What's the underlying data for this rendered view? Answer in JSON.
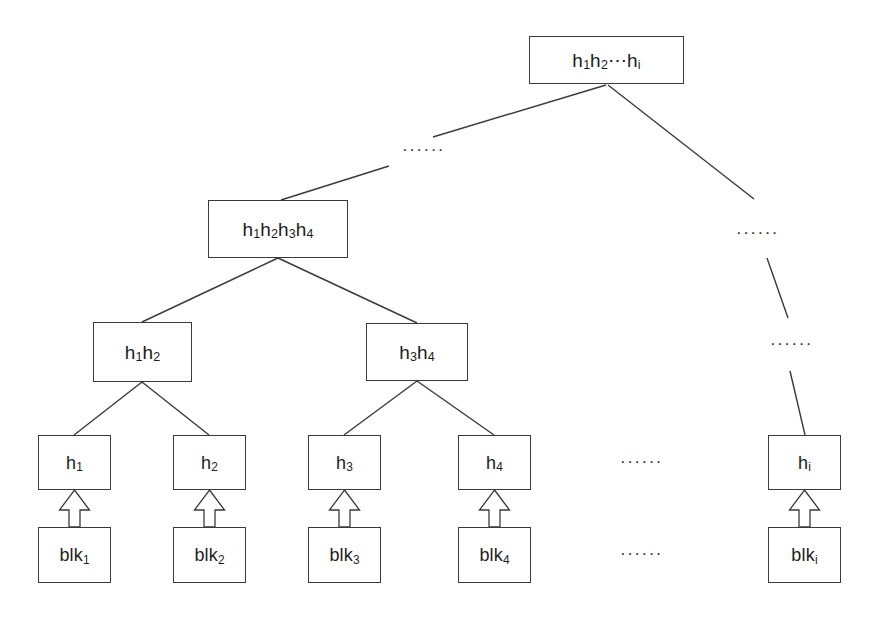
{
  "diagram": {
    "type": "tree",
    "canvas": {
      "width": 874,
      "height": 621
    },
    "colors": {
      "background": "#ffffff",
      "stroke": "#3a3a3a",
      "text": "#1d1d1d",
      "arrow_fill": "#ffffff"
    },
    "nodes": [
      {
        "id": "root",
        "base": "h",
        "sub": "1",
        "text": "h1h2⋯hi",
        "x": 529,
        "y": 36,
        "w": 155,
        "h": 48,
        "font_size": 19
      },
      {
        "id": "n1234",
        "base": "h",
        "sub": "1",
        "text": "h1h2h3h4",
        "x": 208,
        "y": 200,
        "w": 140,
        "h": 58,
        "font_size": 19
      },
      {
        "id": "n12",
        "base": "h",
        "sub": "1",
        "text": "h1h2",
        "x": 93,
        "y": 322,
        "w": 99,
        "h": 60,
        "font_size": 19
      },
      {
        "id": "n34",
        "base": "h",
        "sub": "3",
        "text": "h3h4",
        "x": 366,
        "y": 323,
        "w": 102,
        "h": 58,
        "font_size": 19
      },
      {
        "id": "h1",
        "base": "h",
        "sub": "1",
        "text": "h1",
        "x": 38,
        "y": 435,
        "w": 73,
        "h": 55,
        "font_size": 18
      },
      {
        "id": "h2",
        "base": "h",
        "sub": "2",
        "text": "h2",
        "x": 173,
        "y": 435,
        "w": 73,
        "h": 55,
        "font_size": 18
      },
      {
        "id": "h3",
        "base": "h",
        "sub": "3",
        "text": "h3",
        "x": 308,
        "y": 435,
        "w": 73,
        "h": 55,
        "font_size": 18
      },
      {
        "id": "h4",
        "base": "h",
        "sub": "4",
        "text": "h4",
        "x": 458,
        "y": 435,
        "w": 73,
        "h": 55,
        "font_size": 18
      },
      {
        "id": "hi",
        "base": "h",
        "sub": "i",
        "text": "hi",
        "x": 768,
        "y": 435,
        "w": 73,
        "h": 55,
        "font_size": 18
      },
      {
        "id": "blk1",
        "base": "blk",
        "sub": "1",
        "text": "blk1",
        "x": 38,
        "y": 527,
        "w": 73,
        "h": 56,
        "font_size": 18
      },
      {
        "id": "blk2",
        "base": "blk",
        "sub": "2",
        "text": "blk2",
        "x": 173,
        "y": 527,
        "w": 73,
        "h": 56,
        "font_size": 18
      },
      {
        "id": "blk3",
        "base": "blk",
        "sub": "3",
        "text": "blk3",
        "x": 308,
        "y": 527,
        "w": 73,
        "h": 56,
        "font_size": 18
      },
      {
        "id": "blk4",
        "base": "blk",
        "sub": "4",
        "text": "blk4",
        "x": 458,
        "y": 527,
        "w": 73,
        "h": 56,
        "font_size": 18
      },
      {
        "id": "blki",
        "base": "blk",
        "sub": "i",
        "text": "blki",
        "x": 768,
        "y": 527,
        "w": 73,
        "h": 56,
        "font_size": 18
      }
    ],
    "node_labels": {
      "root": {
        "prefix": "h",
        "sub1": "1",
        "mid": "h",
        "sub2": "2",
        "ellipsis": "⋯",
        "tail": "h",
        "sub3": "i"
      },
      "n1234": {
        "p1": "h",
        "s1": "1",
        "p2": "h",
        "s2": "2",
        "p3": "h",
        "s3": "3",
        "p4": "h",
        "s4": "4"
      },
      "n12": {
        "p1": "h",
        "s1": "1",
        "p2": "h",
        "s2": "2"
      },
      "n34": {
        "p1": "h",
        "s1": "3",
        "p2": "h",
        "s2": "4"
      },
      "h1": {
        "base": "h",
        "sub": "1"
      },
      "h2": {
        "base": "h",
        "sub": "2"
      },
      "h3": {
        "base": "h",
        "sub": "3"
      },
      "h4": {
        "base": "h",
        "sub": "4"
      },
      "hi": {
        "base": "h",
        "sub": "i"
      },
      "blk1": {
        "base": "blk",
        "sub": "1"
      },
      "blk2": {
        "base": "blk",
        "sub": "2"
      },
      "blk3": {
        "base": "blk",
        "sub": "3"
      },
      "blk4": {
        "base": "blk",
        "sub": "4"
      },
      "blki": {
        "base": "blk",
        "sub": "i"
      }
    },
    "edges": [
      {
        "id": "root-to-n1234-upper",
        "from": "root",
        "to": "ellipsis-left",
        "x1": 606,
        "y1": 85,
        "x2": 433,
        "y2": 137
      },
      {
        "id": "root-to-n1234-lower",
        "from": "ellipsis-left",
        "to": "n1234",
        "x1": 389,
        "y1": 166,
        "x2": 281,
        "y2": 200
      },
      {
        "id": "root-to-right-upper",
        "from": "root",
        "to": "ellipsis-right-1",
        "x1": 608,
        "y1": 85,
        "x2": 754,
        "y2": 199
      },
      {
        "id": "right-mid",
        "from": "ellipsis-right-1",
        "to": "ellipsis-right-2",
        "x1": 767,
        "y1": 258,
        "x2": 788,
        "y2": 318
      },
      {
        "id": "right-to-hi",
        "from": "ellipsis-right-2",
        "to": "hi",
        "x1": 790,
        "y1": 371,
        "x2": 805,
        "y2": 435
      },
      {
        "id": "n1234-to-n12",
        "from": "n1234",
        "to": "n12",
        "x1": 278,
        "y1": 258,
        "x2": 142,
        "y2": 322
      },
      {
        "id": "n1234-to-n34",
        "from": "n1234",
        "to": "n34",
        "x1": 278,
        "y1": 258,
        "x2": 417,
        "y2": 323
      },
      {
        "id": "n12-to-h1",
        "from": "n12",
        "to": "h1",
        "x1": 142,
        "y1": 382,
        "x2": 74,
        "y2": 435
      },
      {
        "id": "n12-to-h2",
        "from": "n12",
        "to": "h2",
        "x1": 142,
        "y1": 382,
        "x2": 209,
        "y2": 435
      },
      {
        "id": "n34-to-h3",
        "from": "n34",
        "to": "h3",
        "x1": 417,
        "y1": 381,
        "x2": 344,
        "y2": 435
      },
      {
        "id": "n34-to-h4",
        "from": "n34",
        "to": "h4",
        "x1": 417,
        "y1": 381,
        "x2": 494,
        "y2": 435
      }
    ],
    "block_arrows": [
      {
        "id": "arrow-blk1-h1",
        "from": "blk1",
        "to": "h1",
        "cx": 74.5,
        "y_top": 490,
        "y_bottom": 527
      },
      {
        "id": "arrow-blk2-h2",
        "from": "blk2",
        "to": "h2",
        "cx": 209.5,
        "y_top": 490,
        "y_bottom": 527
      },
      {
        "id": "arrow-blk3-h3",
        "from": "blk3",
        "to": "h3",
        "cx": 344.5,
        "y_top": 490,
        "y_bottom": 527
      },
      {
        "id": "arrow-blk4-h4",
        "from": "blk4",
        "to": "h4",
        "cx": 494.5,
        "y_top": 490,
        "y_bottom": 527
      },
      {
        "id": "arrow-blki-hi",
        "from": "blki",
        "to": "hi",
        "cx": 804.5,
        "y_top": 490,
        "y_bottom": 527
      }
    ],
    "ellipses": [
      {
        "id": "ellipsis-left",
        "text": "······",
        "x": 402,
        "y": 141,
        "font_size": 17
      },
      {
        "id": "ellipsis-right-1",
        "text": "······",
        "x": 736,
        "y": 224,
        "font_size": 17
      },
      {
        "id": "ellipsis-right-2",
        "text": "······",
        "x": 770,
        "y": 335,
        "font_size": 17
      },
      {
        "id": "ellipsis-h-row",
        "text": "······",
        "x": 620,
        "y": 453,
        "font_size": 17
      },
      {
        "id": "ellipsis-blk-row",
        "text": "······",
        "x": 620,
        "y": 545,
        "font_size": 17
      }
    ]
  }
}
